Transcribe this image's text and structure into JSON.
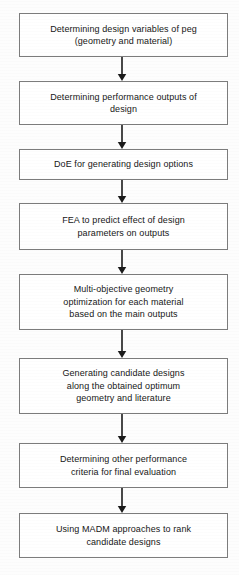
{
  "diagram": {
    "type": "flowchart",
    "orientation": "vertical",
    "title": "",
    "canvas": {
      "width": 239,
      "height": 575,
      "background": "#fdfdfd"
    },
    "style": {
      "node_fill": "#ffffff",
      "node_border": "#7c7c7c",
      "text_color": "#161616",
      "arrow_color": "#1a1a1a"
    },
    "nodes": [
      {
        "id": "n1",
        "label": "Determining design variables of peg\n(geometry and material)",
        "shape": "rectangle",
        "x": 19,
        "y": 13,
        "width": 209,
        "height": 44
      },
      {
        "id": "n2",
        "label": "Determining performance outputs of\ndesign",
        "shape": "rectangle",
        "x": 19,
        "y": 81,
        "width": 209,
        "height": 44
      },
      {
        "id": "n3",
        "label": "DoE for generating design options",
        "shape": "rectangle",
        "x": 19,
        "y": 149,
        "width": 209,
        "height": 31
      },
      {
        "id": "n4",
        "label": "FEA to predict effect of design\nparameters on outputs",
        "shape": "rectangle",
        "x": 19,
        "y": 203,
        "width": 209,
        "height": 47
      },
      {
        "id": "n5",
        "label": "Multi-objective geometry\noptimization for each material\nbased on the main outputs",
        "shape": "rectangle",
        "x": 19,
        "y": 274,
        "width": 209,
        "height": 56
      },
      {
        "id": "n6",
        "label": "Generating candidate designs\nalong the obtained optimum\ngeometry and literature",
        "shape": "rectangle",
        "x": 19,
        "y": 358,
        "width": 209,
        "height": 56
      },
      {
        "id": "n7",
        "label": "Determining other performance\ncriteria for final evaluation",
        "shape": "rectangle",
        "x": 19,
        "y": 443,
        "width": 209,
        "height": 45
      },
      {
        "id": "n8",
        "label": "Using MADM approaches to rank\ncandidate designs",
        "shape": "rectangle",
        "x": 19,
        "y": 513,
        "width": 209,
        "height": 45
      }
    ],
    "edges": [
      {
        "id": "e1",
        "from": "n1",
        "to": "n2",
        "x": 122,
        "y1": 57,
        "y2": 81,
        "arrow": "down"
      },
      {
        "id": "e2",
        "from": "n2",
        "to": "n3",
        "x": 122,
        "y1": 125,
        "y2": 149,
        "arrow": "down"
      },
      {
        "id": "e3",
        "from": "n3",
        "to": "n4",
        "x": 122,
        "y1": 180,
        "y2": 203,
        "arrow": "down"
      },
      {
        "id": "e4",
        "from": "n4",
        "to": "n5",
        "x": 122,
        "y1": 250,
        "y2": 274,
        "arrow": "down"
      },
      {
        "id": "e5",
        "from": "n5",
        "to": "n6",
        "x": 122,
        "y1": 330,
        "y2": 358,
        "arrow": "down"
      },
      {
        "id": "e6",
        "from": "n6",
        "to": "n7",
        "x": 122,
        "y1": 414,
        "y2": 443,
        "arrow": "down"
      },
      {
        "id": "e7",
        "from": "n7",
        "to": "n8",
        "x": 122,
        "y1": 488,
        "y2": 513,
        "arrow": "down"
      }
    ]
  }
}
